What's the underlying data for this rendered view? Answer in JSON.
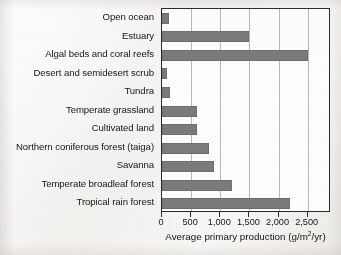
{
  "chart_data": {
    "type": "bar",
    "orientation": "horizontal",
    "title": "",
    "xlabel": "Average primary production (g/m2/yr)",
    "xlabel_parts": {
      "pre": "Average primary production (g/m",
      "sup": "2",
      "post": "/yr)"
    },
    "ylabel": "",
    "categories": [
      "Open ocean",
      "Estuary",
      "Algal beds and coral reefs",
      "Desert and semidesert scrub",
      "Tundra",
      "Temperate grassland",
      "Cultivated land",
      "Northern coniferous forest (taiga)",
      "Savanna",
      "Temperate broadleaf forest",
      "Tropical rain forest"
    ],
    "values": [
      125,
      1500,
      2500,
      90,
      140,
      600,
      600,
      800,
      900,
      1200,
      2200
    ],
    "xlim": [
      0,
      2900
    ],
    "xticks": [
      0,
      500,
      1000,
      1500,
      2000,
      2500
    ],
    "xticklabels": [
      "0",
      "500",
      "1,000",
      "1,500",
      "2,000",
      "2,500"
    ],
    "grid": "vertical",
    "legend": "none",
    "bar_color": "#7b7b7b",
    "axis_color": "#2a2a2a",
    "gridline_color": "#b9b9b9",
    "plot_background": "#fefefe"
  }
}
